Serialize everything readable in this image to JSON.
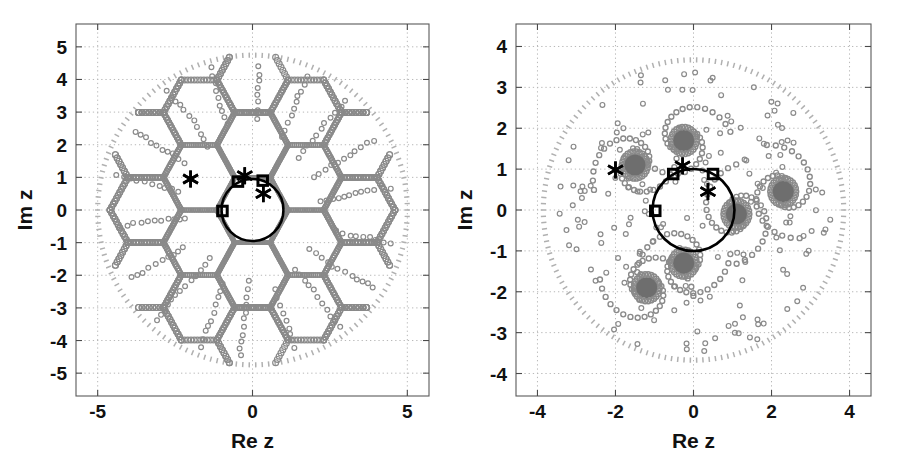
{
  "figure": {
    "background": "#ffffff",
    "width": 901,
    "height": 473,
    "panel_count": 2
  },
  "colors": {
    "marker_ring": "#8a8a8a",
    "marker_ring_dark": "#6f6f6f",
    "blob_fill": "#6e6e6e",
    "boundary_dots": "#b0b0b0",
    "unit_circle": "#000000",
    "asterisk": "#000000",
    "square": "#000000",
    "grid": "#b8b8b8",
    "frame": "#5a5a5a",
    "text": "#111111"
  },
  "chart_data": [
    {
      "id": "left-panel",
      "type": "scatter",
      "title": "",
      "xlabel": "Re z",
      "ylabel": "Im z",
      "xlim": [
        -5.7,
        5.7
      ],
      "ylim": [
        -5.7,
        5.7
      ],
      "xticks": [
        -5,
        0,
        5
      ],
      "xticklabels": [
        "-5",
        "0",
        "5"
      ],
      "yticks": [
        -5,
        -4,
        -3,
        -2,
        -1,
        0,
        1,
        2,
        3,
        4,
        5
      ],
      "yticklabels": [
        "-5",
        "-4",
        "-3",
        "-2",
        "-1",
        "0",
        "1",
        "2",
        "3",
        "4",
        "5"
      ],
      "grid": true,
      "grid_style": "dotted",
      "legend": "none",
      "structure": "hexagonal-lattice-of-small-circles",
      "series": [
        {
          "name": "boundary-circle-dots",
          "marker": "tick-dash",
          "color": "#b0b0b0",
          "radius": 5.0,
          "center": [
            0,
            0
          ],
          "count": 150,
          "description": "outer dotted boundary circle of radius 5"
        },
        {
          "name": "lattice-points",
          "marker": "open-circle",
          "color": "#8a8a8a",
          "description": "small open circles densely tracing hexagonal honeycomb edges radiating from origin",
          "hex_edge_length": 1.15,
          "hex_orientation_deg": 0,
          "rings": 4
        },
        {
          "name": "unit-circle",
          "marker": "solid-line",
          "color": "#000000",
          "radius": 1.0,
          "center": [
            0,
            0
          ],
          "linewidth": 2.6
        },
        {
          "name": "asterisk-markers",
          "marker": "asterisk",
          "color": "#000000",
          "points": [
            [
              -2.0,
              0.95
            ],
            [
              -0.25,
              1.05
            ],
            [
              0.35,
              0.5
            ]
          ]
        },
        {
          "name": "square-markers",
          "marker": "open-square",
          "color": "#000000",
          "points": [
            [
              -0.47,
              0.87
            ],
            [
              0.33,
              0.9
            ],
            [
              -0.97,
              -0.03
            ]
          ]
        }
      ]
    },
    {
      "id": "right-panel",
      "type": "scatter",
      "title": "",
      "xlabel": "Re z",
      "ylabel": "Im z",
      "xlim": [
        -4.55,
        4.55
      ],
      "ylim": [
        -4.55,
        4.55
      ],
      "xticks": [
        -4,
        -2,
        0,
        2,
        4
      ],
      "xticklabels": [
        "-4",
        "-2",
        "0",
        "2",
        "4"
      ],
      "yticks": [
        -4,
        -3,
        -2,
        -1,
        0,
        1,
        2,
        3,
        4
      ],
      "yticklabels": [
        "-4",
        "-3",
        "-2",
        "-1",
        "0",
        "1",
        "2",
        "3",
        "4"
      ],
      "grid": true,
      "grid_style": "dotted",
      "legend": "none",
      "structure": "spiral-vortex-clusters-of-small-circles",
      "series": [
        {
          "name": "boundary-circle-dots",
          "marker": "tick-dash",
          "color": "#b0b0b0",
          "radius": 3.85,
          "center": [
            0,
            0
          ],
          "count": 150,
          "description": "outer dotted boundary circle of radius ~3.85"
        },
        {
          "name": "vortex-blobs",
          "marker": "filled-blob",
          "color": "#6e6e6e",
          "points": [
            [
              -1.5,
              1.1
            ],
            [
              -0.25,
              1.7
            ],
            [
              2.3,
              0.45
            ],
            [
              1.1,
              -0.1
            ],
            [
              -0.25,
              -1.3
            ],
            [
              -1.2,
              -1.9
            ]
          ],
          "blob_radius_data": 0.27
        },
        {
          "name": "spiral-rings",
          "marker": "open-circle",
          "color": "#8a8a8a",
          "description": "open circles spiralling outward around each vortex blob plus scattered field points",
          "turns": 2.4
        },
        {
          "name": "unit-circle",
          "marker": "solid-line",
          "color": "#000000",
          "radius": 1.05,
          "center": [
            0,
            0
          ],
          "linewidth": 2.6
        },
        {
          "name": "asterisk-markers",
          "marker": "asterisk",
          "color": "#000000",
          "points": [
            [
              -2.0,
              0.98
            ],
            [
              -0.28,
              1.08
            ],
            [
              0.37,
              0.45
            ]
          ]
        },
        {
          "name": "square-markers",
          "marker": "open-square",
          "color": "#000000",
          "points": [
            [
              -0.52,
              0.88
            ],
            [
              0.5,
              0.88
            ],
            [
              -0.98,
              -0.02
            ]
          ]
        }
      ]
    }
  ]
}
